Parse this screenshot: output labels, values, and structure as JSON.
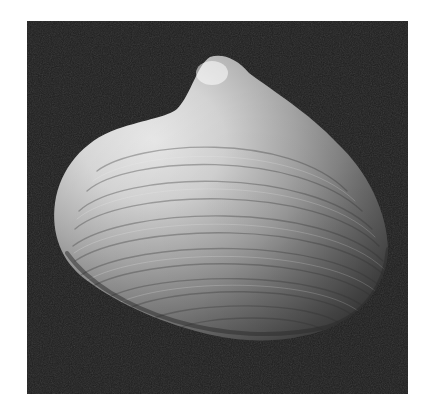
{
  "image": {
    "subject": "clam shell (bivalve) photographed on black background",
    "alt": "Photograph of a single clam shell with concentric growth rings against a dark background",
    "colors": {
      "page_background": "#ffffff",
      "photo_background": "#1e1e1e",
      "shell_highlight": "#f4f4f4",
      "shell_mid": "#9a9a9a",
      "shell_shadow": "#4a4a4a"
    },
    "frame": {
      "x": 27,
      "y": 21,
      "width": 381,
      "height": 373
    }
  }
}
